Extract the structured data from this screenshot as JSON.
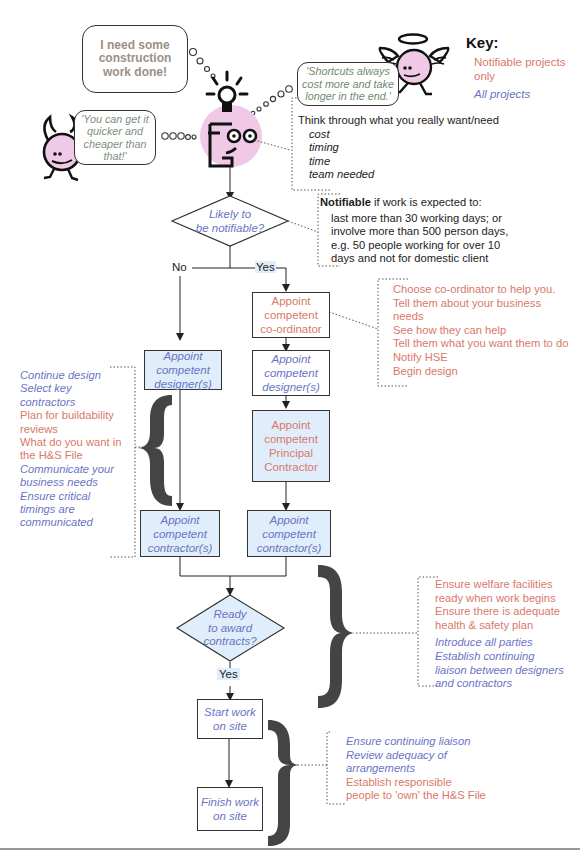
{
  "key": {
    "title": "Key:",
    "notifiable_label": "Notifiable projects only",
    "notifiable_lines": [
      "Notifiable projects",
      "only"
    ],
    "all_label": "All projects",
    "colors": {
      "notifiable": "#d9786a",
      "all": "#6a74c4"
    }
  },
  "bubbles": {
    "client": {
      "lines": [
        "I need some",
        "construction",
        "work done!"
      ]
    },
    "devil": {
      "lines": [
        "'You can get it",
        "quicker and",
        "cheaper than",
        "that!'"
      ]
    },
    "angel": {
      "lines": [
        "'Shortcuts always",
        "cost more and take",
        "longer in the end.'"
      ]
    }
  },
  "think_note": {
    "heading": "Think through what you really want/need",
    "items": [
      "cost",
      "timing",
      "time",
      "team needed"
    ]
  },
  "notifiable_note": {
    "bold": "Notifiable",
    "rest": " if work is expected to:",
    "lines": [
      "last more than 30 working days; or",
      "involve more than 500 person days,",
      "e.g. 50 people working for over 10",
      "days and not for domestic client"
    ]
  },
  "decision1": {
    "lines": [
      "Likely to",
      "be notifiable?"
    ],
    "no": "No",
    "yes": "Yes"
  },
  "coordinator_note": {
    "lines": [
      "Choose co-ordinator to help you.",
      "Tell them about your business",
      "needs",
      "See how they can help",
      "Tell them what you want them to do",
      "Notify HSE",
      "Begin design"
    ]
  },
  "boxes": {
    "coordinator": [
      "Appoint",
      "competent",
      "co-ordinator"
    ],
    "designer_right": [
      "Appoint",
      "competent",
      "designer(s)"
    ],
    "principal_contractor": [
      "Appoint",
      "competent",
      "Principal",
      "Contractor"
    ],
    "contractor_right": [
      "Appoint",
      "competent",
      "contractor(s)"
    ],
    "designer_left": [
      "Appoint",
      "competent",
      "designer(s)"
    ],
    "contractor_left": [
      "Appoint",
      "competent",
      "contractor(s)"
    ],
    "start_work": [
      "Start work",
      "on site"
    ],
    "finish_work": [
      "Finish work",
      "on site"
    ]
  },
  "design_note": {
    "items": [
      {
        "text": "Continue design",
        "type": "all"
      },
      {
        "text": "Select key",
        "type": "all"
      },
      {
        "text": "contractors",
        "type": "all"
      },
      {
        "text": "Plan for buildability",
        "type": "notifiable"
      },
      {
        "text": "reviews",
        "type": "notifiable"
      },
      {
        "text": "What do you want in",
        "type": "notifiable"
      },
      {
        "text": "the H&S File",
        "type": "notifiable"
      },
      {
        "text": "Communicate your",
        "type": "all"
      },
      {
        "text": "business needs",
        "type": "all"
      },
      {
        "text": "Ensure critical",
        "type": "all"
      },
      {
        "text": "timings are",
        "type": "all"
      },
      {
        "text": "communicated",
        "type": "all"
      }
    ]
  },
  "decision2": {
    "lines": [
      "Ready",
      "to award",
      "contracts?"
    ],
    "yes": "Yes"
  },
  "award_note": {
    "red_lines": [
      "Ensure welfare facilities",
      "ready when work begins",
      "Ensure there is adequate",
      "health & safety plan"
    ],
    "blue_lines": [
      "Introduce all parties",
      "Establish continuing",
      "liaison between designers",
      "and contractors"
    ]
  },
  "site_note": {
    "blue_lines": [
      "Ensure continuing liaison",
      "Review adequacy of",
      "arrangements"
    ],
    "red_lines": [
      "Establish responsible",
      "people to 'own' the H&S File"
    ]
  }
}
